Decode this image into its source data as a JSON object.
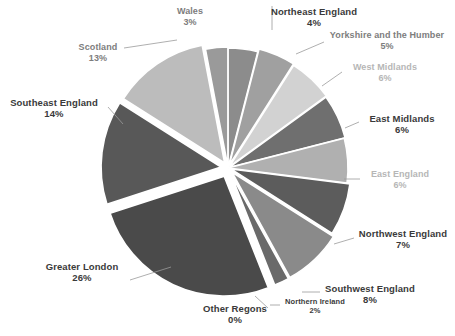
{
  "chart_data": {
    "type": "pie",
    "title": "",
    "subtitle": "",
    "xlabel": "",
    "ylabel": "",
    "legend_position": "none",
    "grid": false,
    "labels_show_percent": true,
    "categories": [
      "Northeast England",
      "Yorkshire and the Humber",
      "West Midlands",
      "East Midlands",
      "East England",
      "Northwest England",
      "Southwest England",
      "Northern Ireland",
      "Other Regons",
      "Greater London",
      "Southeast England",
      "Scotland",
      "Wales"
    ],
    "values": [
      4,
      5,
      6,
      6,
      6,
      7,
      8,
      2,
      0,
      26,
      14,
      13,
      3
    ],
    "value_unit": "%",
    "colors": [
      "#8c8c8c",
      "#a0a0a0",
      "#d2d2d2",
      "#6f6f6f",
      "#b0b0b0",
      "#5c5c5c",
      "#8a8a8a",
      "#6a6a6a",
      "#989898",
      "#4a4a4a",
      "#585858",
      "#bcbcbc",
      "#9a9a9a"
    ]
  },
  "slices": [
    {
      "name": "Wales",
      "percent_text": "3%",
      "label_text": "Wales",
      "tone": "mid",
      "label_x": 162,
      "label_y": 6,
      "label_w": 56,
      "leader": null
    },
    {
      "name": "Northeast England",
      "percent_text": "4%",
      "label_text": "Northeast England",
      "tone": "dark",
      "label_x": 266,
      "label_y": 6,
      "label_w": 96,
      "leader": {
        "x1": 272,
        "y1": 30,
        "x2": 272,
        "y2": 6
      }
    },
    {
      "name": "Yorkshire and the Humber",
      "percent_text": "5%",
      "label_text": "Yorkshire and the Humber",
      "tone": "mid",
      "label_x": 320,
      "label_y": 30,
      "label_w": 134,
      "leader": {
        "x1": 296,
        "y1": 54,
        "x2": 324,
        "y2": 42
      }
    },
    {
      "name": "West Midlands",
      "percent_text": "6%",
      "label_text": "West Midlands",
      "tone": "light",
      "label_x": 341,
      "label_y": 62,
      "label_w": 88,
      "leader": {
        "x1": 322,
        "y1": 86,
        "x2": 342,
        "y2": 72
      }
    },
    {
      "name": "East Midlands",
      "percent_text": "6%",
      "label_text": "East Midlands",
      "tone": "dark",
      "label_x": 357,
      "label_y": 113,
      "label_w": 90,
      "leader": {
        "x1": 345,
        "y1": 128,
        "x2": 359,
        "y2": 122
      }
    },
    {
      "name": "East England",
      "percent_text": "6%",
      "label_text": "East England",
      "tone": "light",
      "label_x": 358,
      "label_y": 169,
      "label_w": 84,
      "leader": {
        "x1": 344,
        "y1": 179,
        "x2": 360,
        "y2": 179
      }
    },
    {
      "name": "Northwest England",
      "percent_text": "7%",
      "label_text": "Northwest England",
      "tone": "dark",
      "label_x": 352,
      "label_y": 228,
      "label_w": 102,
      "leader": {
        "x1": 334,
        "y1": 244,
        "x2": 354,
        "y2": 238
      }
    },
    {
      "name": "Southwest England",
      "percent_text": "8%",
      "label_text": "Southwest England",
      "tone": "dark",
      "label_x": 318,
      "label_y": 283,
      "label_w": 104,
      "leader": {
        "x1": 302,
        "y1": 292,
        "x2": 320,
        "y2": 292
      }
    },
    {
      "name": "Northern Ireland",
      "percent_text": "2%",
      "label_text": "Northern Ireland",
      "tone": "dark",
      "label_x": 277,
      "label_y": 298,
      "label_w": 76,
      "leader": {
        "x1": 270,
        "y1": 305,
        "x2": 280,
        "y2": 305
      }
    },
    {
      "name": "Other Regons",
      "percent_text": "0%",
      "label_text": "Other Regons",
      "tone": "dark",
      "label_x": 194,
      "label_y": 303,
      "label_w": 82,
      "leader": {
        "x1": 255,
        "y1": 296,
        "x2": 268,
        "y2": 308
      }
    },
    {
      "name": "Greater London",
      "percent_text": "26%",
      "label_text": "Greater London",
      "tone": "dark",
      "label_x": 36,
      "label_y": 261,
      "label_w": 92,
      "leader": {
        "x1": 130,
        "y1": 280,
        "x2": 171,
        "y2": 267
      }
    },
    {
      "name": "Southeast England",
      "percent_text": "14%",
      "label_text": "Southeast England",
      "tone": "dark",
      "label_x": 2,
      "label_y": 97,
      "label_w": 104,
      "leader": {
        "x1": 108,
        "y1": 107,
        "x2": 123,
        "y2": 124
      }
    },
    {
      "name": "Scotland",
      "percent_text": "13%",
      "label_text": "Scotland",
      "tone": "mid",
      "label_x": 68,
      "label_y": 42,
      "label_w": 60,
      "leader": {
        "x1": 124,
        "y1": 48,
        "x2": 177,
        "y2": 40
      }
    }
  ]
}
